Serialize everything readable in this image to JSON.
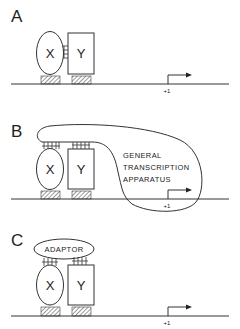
{
  "figure": {
    "panels": [
      {
        "id": "A",
        "label": "A",
        "factor_x": "X",
        "factor_y": "Y",
        "start_site": "+1"
      },
      {
        "id": "B",
        "label": "B",
        "factor_x": "X",
        "factor_y": "Y",
        "start_site": "+1",
        "complex_label_lines": [
          "GENERAL",
          "TRANSCRIPTION",
          "APPARATUS"
        ]
      },
      {
        "id": "C",
        "label": "C",
        "factor_x": "X",
        "factor_y": "Y",
        "start_site": "+1",
        "adaptor_label": "ADAPTOR"
      }
    ]
  },
  "colors": {
    "line": "#333333",
    "background": "#ffffff"
  }
}
